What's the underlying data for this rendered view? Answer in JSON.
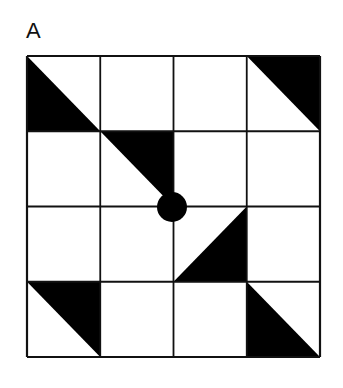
{
  "panel": {
    "label": "A"
  },
  "grid": {
    "rows": 4,
    "cols": 4,
    "left": 27,
    "top": 56,
    "right": 320,
    "bottom": 357,
    "line_color": "#111111",
    "fill_color": "#000000"
  },
  "triangles": [
    {
      "row": 0,
      "col": 0,
      "shape": "lower-left"
    },
    {
      "row": 0,
      "col": 3,
      "shape": "upper-right"
    },
    {
      "row": 1,
      "col": 1,
      "shape": "upper-right"
    },
    {
      "row": 2,
      "col": 2,
      "shape": "lower-right"
    },
    {
      "row": 3,
      "col": 0,
      "shape": "upper-right"
    },
    {
      "row": 3,
      "col": 3,
      "shape": "lower-left"
    }
  ],
  "center_dot": {
    "cx": 172,
    "cy": 207,
    "r": 15
  }
}
